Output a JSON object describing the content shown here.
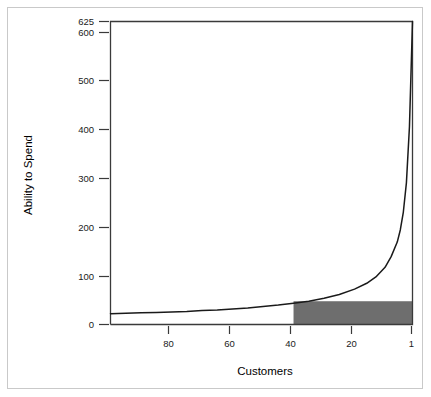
{
  "chart_data": {
    "type": "line",
    "title": "",
    "subtitle": "",
    "xlabel": "Customers",
    "ylabel": "Ability to Spend",
    "grid": false,
    "legend": null,
    "x_axis": {
      "label": "Customers",
      "tick_labels": [
        "80",
        "60",
        "40",
        "20",
        "1"
      ],
      "tick_values": [
        80,
        60,
        40,
        20,
        1
      ],
      "direction": "descending",
      "range": [
        100,
        1
      ]
    },
    "y_axis": {
      "label": "Ability to Spend",
      "tick_labels": [
        "0",
        "100",
        "200",
        "300",
        "400",
        "500",
        "600",
        "625"
      ],
      "tick_values": [
        0,
        100,
        200,
        300,
        400,
        500,
        600,
        625
      ],
      "range": [
        0,
        625
      ]
    },
    "series": [
      {
        "name": "Ability to Spend",
        "type": "line",
        "color": "#1a1a1a",
        "x": [
          100,
          95,
          90,
          85,
          80,
          75,
          70,
          65,
          60,
          55,
          50,
          45,
          40,
          35,
          30,
          25,
          20,
          16,
          13,
          10,
          8,
          6,
          5,
          4,
          3,
          2,
          1
        ],
        "values": [
          22,
          23,
          24,
          25,
          26,
          27,
          29,
          30,
          32,
          34,
          37,
          40,
          44,
          48,
          54,
          62,
          73,
          85,
          98,
          118,
          140,
          170,
          195,
          232,
          292,
          408,
          625
        ]
      }
    ],
    "annotations": [
      {
        "type": "rect",
        "name": "highlighted-region",
        "color": "#6e6e6e",
        "x_start": 40,
        "x_end": 1,
        "y_start": 0,
        "y_end": 48,
        "label": ""
      }
    ]
  },
  "axes": {
    "y_label": "Ability to Spend",
    "x_label": "Customers",
    "y_ticks": [
      {
        "label": "625",
        "value": 625
      },
      {
        "label": "600",
        "value": 600
      },
      {
        "label": "500",
        "value": 500
      },
      {
        "label": "400",
        "value": 400
      },
      {
        "label": "300",
        "value": 300
      },
      {
        "label": "200",
        "value": 200
      },
      {
        "label": "100",
        "value": 100
      },
      {
        "label": "0",
        "value": 0
      }
    ],
    "x_ticks": [
      {
        "label": "80",
        "value": 80
      },
      {
        "label": "60",
        "value": 60
      },
      {
        "label": "40",
        "value": 40
      },
      {
        "label": "20",
        "value": 20
      },
      {
        "label": "1",
        "value": 1
      }
    ]
  },
  "colors": {
    "curve": "#1a1a1a",
    "shaded_region": "#6e6e6e",
    "axis": "#3a3a3a",
    "frame": "#c9c9c9",
    "background": "#ffffff"
  }
}
